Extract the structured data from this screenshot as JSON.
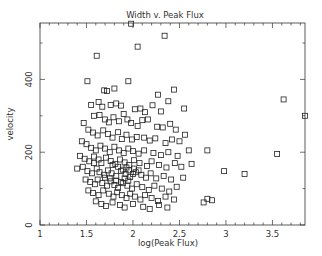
{
  "chart_data": {
    "type": "scatter",
    "title": "Width v. Peak Flux",
    "xlabel": "log(Peak Flux)",
    "ylabel": "velocity",
    "xlim": [
      1,
      3.85
    ],
    "ylim": [
      0,
      555
    ],
    "xticks": [
      1,
      1.5,
      2,
      2.5,
      3,
      3.5
    ],
    "xtick_labels": [
      "1",
      "1.5",
      "2",
      "2.5",
      "3",
      "3.5"
    ],
    "yticks": [
      0,
      200,
      400
    ],
    "ytick_labels": [
      "0",
      "200",
      "400"
    ],
    "grid": false,
    "legend": null,
    "marker": "open-square",
    "series": [
      {
        "name": "sources",
        "points": [
          [
            1.98,
            553
          ],
          [
            2.34,
            520
          ],
          [
            2.05,
            490
          ],
          [
            1.61,
            465
          ],
          [
            1.95,
            395
          ],
          [
            1.69,
            370
          ],
          [
            1.72,
            368
          ],
          [
            1.8,
            375
          ],
          [
            2.27,
            358
          ],
          [
            2.44,
            372
          ],
          [
            2.38,
            340
          ],
          [
            1.51,
            395
          ],
          [
            1.55,
            330
          ],
          [
            1.63,
            338
          ],
          [
            1.67,
            325
          ],
          [
            1.76,
            330
          ],
          [
            1.82,
            334
          ],
          [
            1.87,
            328
          ],
          [
            2.02,
            318
          ],
          [
            2.08,
            320
          ],
          [
            2.13,
            310
          ],
          [
            2.21,
            329
          ],
          [
            2.3,
            312
          ],
          [
            2.55,
            320
          ],
          [
            3.62,
            345
          ],
          [
            3.85,
            300
          ],
          [
            1.58,
            300
          ],
          [
            1.64,
            302
          ],
          [
            1.7,
            290
          ],
          [
            1.74,
            282
          ],
          [
            1.79,
            296
          ],
          [
            1.85,
            285
          ],
          [
            1.9,
            305
          ],
          [
            1.94,
            290
          ],
          [
            1.98,
            280
          ],
          [
            2.05,
            272
          ],
          [
            2.1,
            288
          ],
          [
            2.16,
            290
          ],
          [
            2.26,
            270
          ],
          [
            2.32,
            268
          ],
          [
            2.4,
            278
          ],
          [
            2.46,
            262
          ],
          [
            1.47,
            280
          ],
          [
            1.52,
            262
          ],
          [
            1.57,
            254
          ],
          [
            1.62,
            246
          ],
          [
            1.68,
            260
          ],
          [
            1.73,
            250
          ],
          [
            1.78,
            240
          ],
          [
            1.84,
            255
          ],
          [
            1.88,
            236
          ],
          [
            1.93,
            248
          ],
          [
            1.99,
            235
          ],
          [
            2.04,
            242
          ],
          [
            2.12,
            240
          ],
          [
            2.18,
            232
          ],
          [
            2.24,
            238
          ],
          [
            2.35,
            225
          ],
          [
            2.42,
            235
          ],
          [
            2.5,
            230
          ],
          [
            2.56,
            248
          ],
          [
            1.45,
            230
          ],
          [
            1.5,
            222
          ],
          [
            1.55,
            212
          ],
          [
            1.6,
            205
          ],
          [
            1.65,
            218
          ],
          [
            1.7,
            210
          ],
          [
            1.75,
            200
          ],
          [
            1.8,
            215
          ],
          [
            1.85,
            205
          ],
          [
            1.9,
            198
          ],
          [
            1.95,
            210
          ],
          [
            2.0,
            203
          ],
          [
            2.06,
            196
          ],
          [
            2.12,
            205
          ],
          [
            2.22,
            198
          ],
          [
            2.3,
            192
          ],
          [
            2.38,
            200
          ],
          [
            2.48,
            190
          ],
          [
            2.6,
            205
          ],
          [
            2.8,
            205
          ],
          [
            3.55,
            195
          ],
          [
            1.43,
            190
          ],
          [
            1.48,
            182
          ],
          [
            1.53,
            175
          ],
          [
            1.58,
            188
          ],
          [
            1.63,
            180
          ],
          [
            1.66,
            170
          ],
          [
            1.71,
            185
          ],
          [
            1.76,
            176
          ],
          [
            1.81,
            168
          ],
          [
            1.86,
            180
          ],
          [
            1.91,
            172
          ],
          [
            1.96,
            165
          ],
          [
            2.01,
            178
          ],
          [
            2.07,
            170
          ],
          [
            2.15,
            162
          ],
          [
            2.2,
            175
          ],
          [
            2.28,
            165
          ],
          [
            2.36,
            158
          ],
          [
            2.45,
            170
          ],
          [
            2.52,
            160
          ],
          [
            2.63,
            168
          ],
          [
            2.98,
            148
          ],
          [
            3.2,
            140
          ],
          [
            1.4,
            155
          ],
          [
            1.46,
            160
          ],
          [
            1.51,
            148
          ],
          [
            1.56,
            142
          ],
          [
            1.61,
            155
          ],
          [
            1.64,
            145
          ],
          [
            1.69,
            138
          ],
          [
            1.73,
            150
          ],
          [
            1.77,
            142
          ],
          [
            1.82,
            135
          ],
          [
            1.87,
            148
          ],
          [
            1.92,
            140
          ],
          [
            1.97,
            132
          ],
          [
            2.03,
            145
          ],
          [
            2.09,
            138
          ],
          [
            2.14,
            130
          ],
          [
            2.19,
            142
          ],
          [
            2.25,
            128
          ],
          [
            2.33,
            135
          ],
          [
            2.41,
            125
          ],
          [
            2.54,
            130
          ],
          [
            1.49,
            125
          ],
          [
            1.54,
            118
          ],
          [
            1.59,
            112
          ],
          [
            1.62,
            125
          ],
          [
            1.67,
            115
          ],
          [
            1.72,
            108
          ],
          [
            1.76,
            120
          ],
          [
            1.8,
            110
          ],
          [
            1.84,
            102
          ],
          [
            1.89,
            115
          ],
          [
            1.94,
            108
          ],
          [
            1.99,
            100
          ],
          [
            2.04,
            112
          ],
          [
            2.1,
            104
          ],
          [
            2.17,
            96
          ],
          [
            2.23,
            108
          ],
          [
            2.31,
            100
          ],
          [
            2.39,
            92
          ],
          [
            2.47,
            105
          ],
          [
            1.52,
            95
          ],
          [
            1.57,
            88
          ],
          [
            1.63,
            82
          ],
          [
            1.68,
            95
          ],
          [
            1.74,
            86
          ],
          [
            1.79,
            78
          ],
          [
            1.83,
            90
          ],
          [
            1.88,
            82
          ],
          [
            1.93,
            74
          ],
          [
            1.97,
            86
          ],
          [
            2.02,
            78
          ],
          [
            2.08,
            70
          ],
          [
            2.13,
            82
          ],
          [
            2.2,
            74
          ],
          [
            2.27,
            66
          ],
          [
            2.35,
            78
          ],
          [
            2.44,
            70
          ],
          [
            1.6,
            65
          ],
          [
            1.66,
            58
          ],
          [
            1.71,
            52
          ],
          [
            1.78,
            62
          ],
          [
            1.86,
            55
          ],
          [
            1.91,
            48
          ],
          [
            2.0,
            58
          ],
          [
            2.11,
            50
          ],
          [
            2.18,
            44
          ],
          [
            2.28,
            55
          ],
          [
            2.37,
            48
          ],
          [
            2.76,
            62
          ],
          [
            2.85,
            68
          ],
          [
            2.8,
            72
          ],
          [
            1.58,
            170
          ],
          [
            1.78,
            165
          ],
          [
            1.84,
            160
          ],
          [
            1.89,
            152
          ],
          [
            1.93,
            158
          ],
          [
            1.96,
            150
          ],
          [
            2.01,
            155
          ],
          [
            1.7,
            130
          ],
          [
            1.75,
            128
          ],
          [
            1.82,
            122
          ],
          [
            1.87,
            118
          ],
          [
            1.91,
            128
          ],
          [
            1.95,
            122
          ],
          [
            2.06,
            150
          ],
          [
            2.0,
            140
          ]
        ]
      }
    ]
  }
}
